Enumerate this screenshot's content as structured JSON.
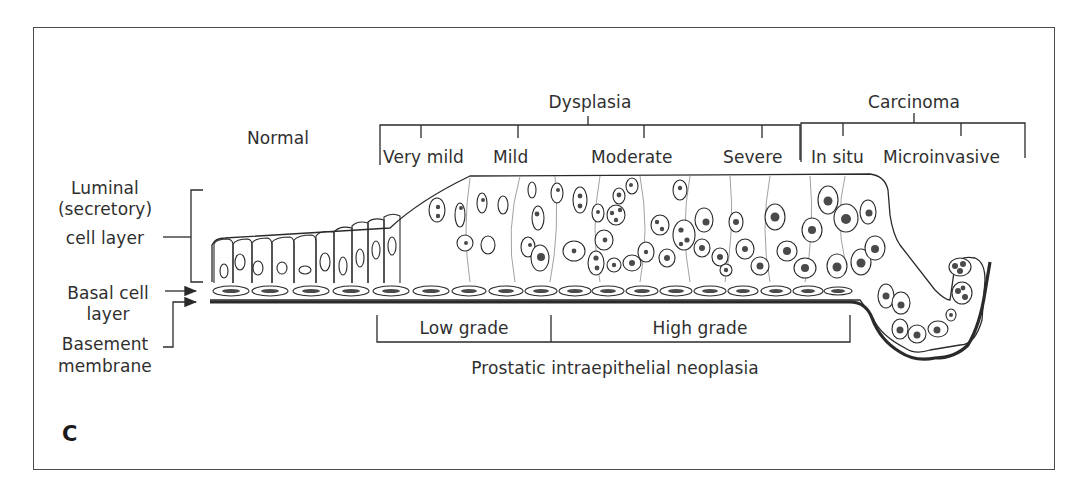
{
  "panel": {
    "letter": "C"
  },
  "stages": {
    "normal": "Normal",
    "dysplasia": {
      "title": "Dysplasia",
      "grades": [
        "Very mild",
        "Mild",
        "Moderate",
        "Severe"
      ]
    },
    "carcinoma": {
      "title": "Carcinoma",
      "grades": [
        "In situ",
        "Microinvasive"
      ]
    }
  },
  "layers": {
    "luminal": [
      "Luminal",
      "(secretory)",
      "cell layer"
    ],
    "basal": [
      "Basal cell",
      "layer"
    ],
    "basement": [
      "Basement",
      "membrane"
    ]
  },
  "pin": {
    "low_grade": "Low grade",
    "high_grade": "High grade",
    "title": "Prostatic intraepithelial neoplasia"
  },
  "colors": {
    "line": "#2a2a2a",
    "thin_line": "#8a8a8a",
    "nucleus": "#4a4a4a",
    "frame": "#4a4a4a"
  }
}
